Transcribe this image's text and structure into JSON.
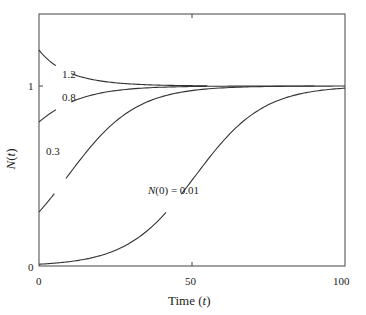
{
  "chart_data": {
    "type": "line",
    "title": "",
    "xlabel": "Time (t)",
    "ylabel": "N(t)",
    "xlim": [
      0,
      100
    ],
    "ylim": [
      0,
      1.4
    ],
    "x_ticks": [
      0,
      50,
      100
    ],
    "x_tick_labels": [
      "0",
      "50",
      "100"
    ],
    "y_ticks": [
      0,
      1
    ],
    "y_tick_labels": [
      "0",
      "1"
    ],
    "grid": false,
    "legend": "none (inline curve labels)",
    "model": "logistic: N(t) = 1 / (1 + ((1 - N0)/N0) * exp(-r t)), r ≈ 0.09",
    "growth_rate_r": 0.09,
    "series": [
      {
        "name": "1.2",
        "label": "1.2",
        "N0": 1.2,
        "t_end": 55,
        "x": [
          0,
          5,
          10,
          20,
          30,
          40,
          55
        ],
        "values": [
          1.2,
          1.13,
          1.08,
          1.03,
          1.01,
          1.005,
          1.0
        ],
        "break_t": [
          5.5,
          10.5
        ]
      },
      {
        "name": "0.8",
        "label": "0.8",
        "N0": 0.8,
        "t_end": 90,
        "x": [
          0,
          5,
          10,
          20,
          30,
          40,
          60,
          90
        ],
        "values": [
          0.8,
          0.86,
          0.91,
          0.96,
          0.98,
          0.99,
          1.0,
          1.0
        ],
        "break_t": [
          5.5,
          10.5
        ]
      },
      {
        "name": "0.3",
        "label": "0.3",
        "N0": 0.3,
        "t_end": 100,
        "x": [
          0,
          10,
          20,
          30,
          40,
          50,
          60,
          80,
          100
        ],
        "values": [
          0.3,
          0.51,
          0.72,
          0.86,
          0.93,
          0.97,
          0.99,
          1.0,
          1.0
        ],
        "break_t": [
          5.0,
          8.8
        ]
      },
      {
        "name": "N(0) = 0.01",
        "label": "N(0) = 0.01",
        "N0": 0.01,
        "t_end": 100,
        "x": [
          0,
          10,
          20,
          30,
          40,
          50,
          60,
          70,
          80,
          90,
          100
        ],
        "values": [
          0.01,
          0.024,
          0.057,
          0.13,
          0.27,
          0.48,
          0.69,
          0.84,
          0.93,
          0.97,
          0.99
        ],
        "break_t": [
          41.5,
          46.5
        ]
      }
    ],
    "labels": [
      {
        "text": "1.2",
        "x_px": 62,
        "y_px": 74
      },
      {
        "text": "0.8",
        "x_px": 62,
        "y_px": 97
      },
      {
        "text": "0.3",
        "x_px": 46,
        "y_px": 151
      },
      {
        "text_prefix": "N",
        "text_suffix": "(0) = 0.01",
        "x_px": 148,
        "y_px": 190
      }
    ]
  },
  "axes": {
    "xlabel_prefix": "Time (",
    "xlabel_var": "t",
    "xlabel_suffix": ")",
    "ylabel_var": "N",
    "ylabel_open": "(",
    "ylabel_arg": "t",
    "ylabel_close": ")"
  },
  "style": {
    "line_color": "#333333",
    "axis_color": "#444444",
    "background": "#ffffff"
  }
}
